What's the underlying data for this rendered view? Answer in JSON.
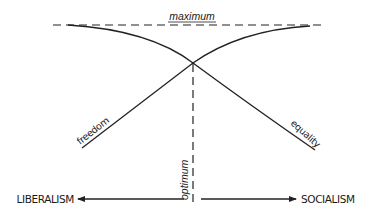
{
  "diagram": {
    "title": "",
    "colors": {
      "line": "#222222",
      "text": "#1a1a1a",
      "background": "#ffffff"
    },
    "labels": {
      "maximum": "maximum",
      "optimum": "optimum",
      "freedom": "freedom",
      "equality": "equality",
      "left_pole": "LIBERALISM",
      "right_pole": "SOCIALISM"
    },
    "elements": {
      "maximum_line": {
        "style": "dashed",
        "orientation": "horizontal",
        "label": "maximum"
      },
      "optimum_line": {
        "style": "dashed",
        "orientation": "vertical",
        "label": "optimum"
      },
      "freedom_curve": {
        "direction": "rises from bottom-left to top-right",
        "label": "freedom"
      },
      "equality_curve": {
        "direction": "falls from top-left to bottom-right",
        "label": "equality"
      },
      "axis": {
        "left_arrow_to": "LIBERALISM",
        "right_arrow_to": "SOCIALISM"
      }
    }
  }
}
